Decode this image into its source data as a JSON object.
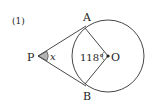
{
  "problem": {
    "number": "(1)"
  },
  "points": {
    "P": {
      "label": "P",
      "x": 38,
      "y": 56
    },
    "A": {
      "label": "A",
      "x": 84,
      "y": 27
    },
    "B": {
      "label": "B",
      "x": 84,
      "y": 85
    },
    "O": {
      "label": "O",
      "x": 108,
      "y": 56
    }
  },
  "circle": {
    "cx": 108,
    "cy": 56,
    "r": 36
  },
  "angles": {
    "P": {
      "label": "x",
      "shaded": true,
      "color": "#b5b5b5"
    },
    "AOB": {
      "label": "118°"
    }
  },
  "colors": {
    "stroke": "#333333",
    "text": "#222222",
    "background": "#ffffff"
  }
}
